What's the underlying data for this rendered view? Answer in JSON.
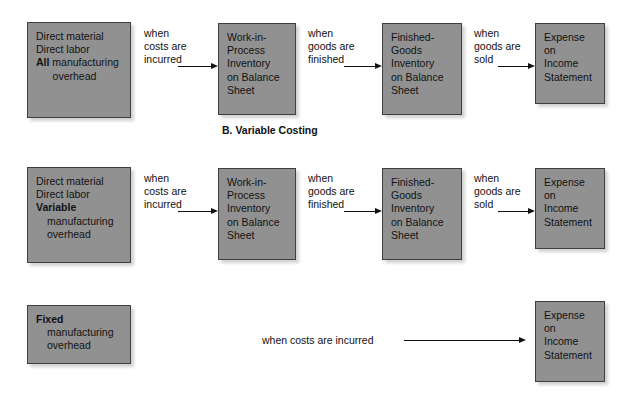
{
  "figure": {
    "section_heading": "B. Variable Costing",
    "box_fill_color": "#919191",
    "box_border_color": "#3f3f3f",
    "text_color": "#111111"
  },
  "row_absorption": {
    "cost_box": {
      "line1": "Direct material",
      "line2": "Direct labor",
      "line3_bold": "All",
      "line3_rest": " manufacturing",
      "line4": "overhead"
    },
    "label1": {
      "l1": "when",
      "l2": "costs are",
      "l3": "incurred"
    },
    "wip_box": {
      "l1": "Work-in-",
      "l2": "Process",
      "l3": "Inventory",
      "l4": "on Balance",
      "l5": "Sheet"
    },
    "label2": {
      "l1": "when",
      "l2": "goods are",
      "l3": "finished"
    },
    "fg_box": {
      "l1": "Finished-",
      "l2": "Goods",
      "l3": "Inventory",
      "l4": "on Balance",
      "l5": "Sheet"
    },
    "label3": {
      "l1": "when",
      "l2": "goods are",
      "l3": "sold"
    },
    "expense_box": {
      "l1": "Expense",
      "l2": "on",
      "l3": "Income",
      "l4": "Statement"
    }
  },
  "row_variable": {
    "cost_box": {
      "line1": "Direct material",
      "line2": "Direct labor",
      "line3_bold": "Variable",
      "line4": "manufacturing",
      "line5": "overhead"
    },
    "label1": {
      "l1": "when",
      "l2": "costs are",
      "l3": "incurred"
    },
    "wip_box": {
      "l1": "Work-in-",
      "l2": "Process",
      "l3": "Inventory",
      "l4": "on Balance",
      "l5": "Sheet"
    },
    "label2": {
      "l1": "when",
      "l2": "goods are",
      "l3": "finished"
    },
    "fg_box": {
      "l1": "Finished-",
      "l2": "Goods",
      "l3": "Inventory",
      "l4": "on Balance",
      "l5": "Sheet"
    },
    "label3": {
      "l1": "when",
      "l2": "goods are",
      "l3": "sold"
    },
    "expense_box": {
      "l1": "Expense",
      "l2": "on",
      "l3": "Income",
      "l4": "Statement"
    }
  },
  "row_fixed": {
    "cost_box": {
      "line1_bold": "Fixed",
      "line2": "manufacturing",
      "line3": "overhead"
    },
    "label": "when costs are incurred",
    "expense_box": {
      "l1": "Expense",
      "l2": "on",
      "l3": "Income",
      "l4": "Statement"
    }
  }
}
